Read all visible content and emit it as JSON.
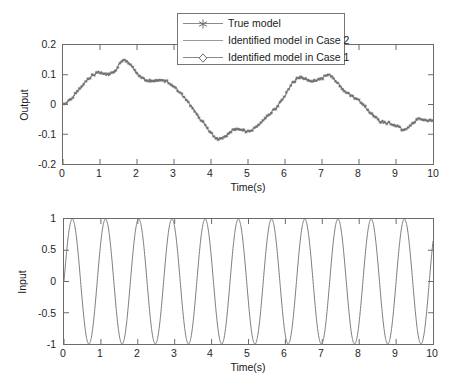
{
  "figure": {
    "background": "#ffffff",
    "axis_color": "#6b6b6b",
    "curve_color": "#7d7d7d",
    "marker_color": "#6e6e6e"
  },
  "legend": {
    "entries": [
      {
        "label": "True model",
        "marker": "asterisk-marker-icon",
        "color": "#7d7d7d"
      },
      {
        "label": "Identified model in Case 2",
        "marker": "none",
        "color": "#8f8f8f"
      },
      {
        "label": "Identified model in Case 1",
        "marker": "diamond-marker-icon",
        "color": "#7d7d7d"
      }
    ]
  },
  "panels": [
    {
      "id": "output-panel",
      "ylabel": "Output",
      "xlabel": "Time(s)",
      "yticks": [
        "0.2",
        "0.1",
        "0",
        "-0.1",
        "-0.2"
      ],
      "xticks": [
        "0",
        "1",
        "2",
        "3",
        "4",
        "5",
        "6",
        "7",
        "8",
        "9",
        "10"
      ]
    },
    {
      "id": "input-panel",
      "ylabel": "Input",
      "xlabel": "Time(s)",
      "yticks": [
        "1",
        "0.5",
        "0",
        "-0.5",
        "-1"
      ],
      "xticks": [
        "0",
        "1",
        "2",
        "3",
        "4",
        "5",
        "6",
        "7",
        "8",
        "9",
        "10"
      ]
    }
  ],
  "chart_data": [
    {
      "type": "line",
      "id": "output-plot",
      "title": "",
      "xlabel": "Time(s)",
      "ylabel": "Output",
      "xlim": [
        0,
        10
      ],
      "ylim": [
        -0.2,
        0.2
      ],
      "xticks": [
        0,
        1,
        2,
        3,
        4,
        5,
        6,
        7,
        8,
        9,
        10
      ],
      "yticks": [
        -0.2,
        -0.1,
        0,
        0.1,
        0.2
      ],
      "grid": false,
      "legend_position": "top-center",
      "series": [
        {
          "name": "True model",
          "marker": "asterisk",
          "x": [
            0,
            0.2,
            0.4,
            0.6,
            0.8,
            1.0,
            1.2,
            1.4,
            1.6,
            1.8,
            2.0,
            2.2,
            2.4,
            2.6,
            2.8,
            3.0,
            3.2,
            3.4,
            3.6,
            3.8,
            4.0,
            4.2,
            4.4,
            4.6,
            4.8,
            5.0,
            5.2,
            5.4,
            5.6,
            5.8,
            6.0,
            6.2,
            6.4,
            6.6,
            6.8,
            7.0,
            7.2,
            7.4,
            7.6,
            7.8,
            8.0,
            8.2,
            8.4,
            8.6,
            8.8,
            9.0,
            9.2,
            9.4,
            9.6,
            9.8,
            10.0
          ],
          "values": [
            0.0,
            0.018,
            0.045,
            0.075,
            0.098,
            0.108,
            0.1,
            0.112,
            0.148,
            0.138,
            0.105,
            0.085,
            0.078,
            0.082,
            0.078,
            0.06,
            0.035,
            0.005,
            -0.03,
            -0.062,
            -0.095,
            -0.115,
            -0.105,
            -0.085,
            -0.085,
            -0.09,
            -0.078,
            -0.055,
            -0.03,
            -0.005,
            0.03,
            0.07,
            0.092,
            0.082,
            0.078,
            0.088,
            0.1,
            0.075,
            0.048,
            0.03,
            0.012,
            -0.012,
            -0.038,
            -0.058,
            -0.062,
            -0.07,
            -0.085,
            -0.07,
            -0.05,
            -0.055,
            -0.052
          ]
        },
        {
          "name": "Identified model in Case 2",
          "marker": "none",
          "x": [
            0,
            0.2,
            0.4,
            0.6,
            0.8,
            1.0,
            1.2,
            1.4,
            1.6,
            1.8,
            2.0,
            2.2,
            2.4,
            2.6,
            2.8,
            3.0,
            3.2,
            3.4,
            3.6,
            3.8,
            4.0,
            4.2,
            4.4,
            4.6,
            4.8,
            5.0,
            5.2,
            5.4,
            5.6,
            5.8,
            6.0,
            6.2,
            6.4,
            6.6,
            6.8,
            7.0,
            7.2,
            7.4,
            7.6,
            7.8,
            8.0,
            8.2,
            8.4,
            8.6,
            8.8,
            9.0,
            9.2,
            9.4,
            9.6,
            9.8,
            10.0
          ],
          "values": [
            0.0,
            0.018,
            0.045,
            0.075,
            0.098,
            0.108,
            0.1,
            0.112,
            0.148,
            0.138,
            0.105,
            0.085,
            0.078,
            0.082,
            0.078,
            0.06,
            0.035,
            0.005,
            -0.03,
            -0.062,
            -0.095,
            -0.115,
            -0.105,
            -0.085,
            -0.085,
            -0.09,
            -0.078,
            -0.055,
            -0.03,
            -0.005,
            0.03,
            0.07,
            0.092,
            0.082,
            0.078,
            0.088,
            0.1,
            0.075,
            0.048,
            0.03,
            0.012,
            -0.012,
            -0.038,
            -0.058,
            -0.062,
            -0.07,
            -0.085,
            -0.07,
            -0.05,
            -0.055,
            -0.052
          ]
        },
        {
          "name": "Identified model in Case 1",
          "marker": "diamond",
          "x": [
            0,
            0.2,
            0.4,
            0.6,
            0.8,
            1.0,
            1.2,
            1.4,
            1.6,
            1.8,
            2.0,
            2.2,
            2.4,
            2.6,
            2.8,
            3.0,
            3.2,
            3.4,
            3.6,
            3.8,
            4.0,
            4.2,
            4.4,
            4.6,
            4.8,
            5.0,
            5.2,
            5.4,
            5.6,
            5.8,
            6.0,
            6.2,
            6.4,
            6.6,
            6.8,
            7.0,
            7.2,
            7.4,
            7.6,
            7.8,
            8.0,
            8.2,
            8.4,
            8.6,
            8.8,
            9.0,
            9.2,
            9.4,
            9.6,
            9.8,
            10.0
          ],
          "values": [
            0.0,
            0.018,
            0.045,
            0.075,
            0.098,
            0.108,
            0.1,
            0.112,
            0.148,
            0.138,
            0.105,
            0.085,
            0.078,
            0.082,
            0.078,
            0.06,
            0.035,
            0.005,
            -0.03,
            -0.062,
            -0.095,
            -0.115,
            -0.105,
            -0.085,
            -0.085,
            -0.09,
            -0.078,
            -0.055,
            -0.03,
            -0.005,
            0.03,
            0.07,
            0.092,
            0.082,
            0.078,
            0.088,
            0.1,
            0.075,
            0.048,
            0.03,
            0.012,
            -0.012,
            -0.038,
            -0.058,
            -0.062,
            -0.07,
            -0.085,
            -0.07,
            -0.05,
            -0.055,
            -0.052
          ]
        }
      ]
    },
    {
      "type": "line",
      "id": "input-plot",
      "title": "",
      "xlabel": "Time(s)",
      "ylabel": "Input",
      "xlim": [
        0,
        10
      ],
      "ylim": [
        -1,
        1
      ],
      "xticks": [
        0,
        1,
        2,
        3,
        4,
        5,
        6,
        7,
        8,
        9,
        10
      ],
      "yticks": [
        -1,
        -0.5,
        0,
        0.5,
        1
      ],
      "grid": false,
      "legend_position": "none",
      "series": [
        {
          "name": "Input",
          "marker": "none",
          "waveform": "sine",
          "amplitude": 1,
          "period_s": 0.9,
          "cycles": 11,
          "phase_rad": 0
        }
      ]
    }
  ]
}
